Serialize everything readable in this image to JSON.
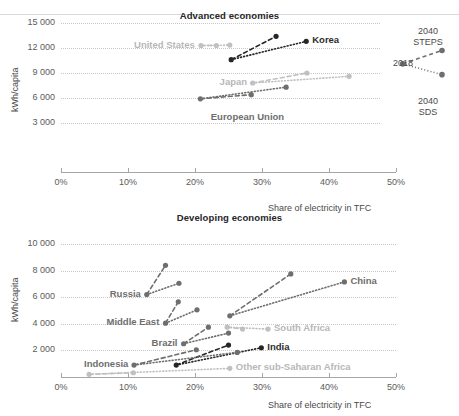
{
  "figure": {
    "ylabel": "kWh/capita",
    "xlabel": "Share of electricity in TFC"
  },
  "legend": {
    "base_label": "2018",
    "steps_label_line1": "2040",
    "steps_label_line2": "STEPS",
    "sds_label_line1": "2040",
    "sds_label_line2": "SDS",
    "base_point": {
      "x": 51.0,
      "y": 10100
    },
    "steps_point": {
      "x": 57.0,
      "y": 11700
    },
    "sds_point": {
      "x": 57.0,
      "y": 8800
    }
  },
  "colors": {
    "dark": "#262626",
    "mid": "#6e6e6e",
    "light": "#c0c0c0",
    "grid": "#c7c7c7",
    "axis": "#a6a6a6"
  },
  "chart_data": [
    {
      "type": "line",
      "title": "Advanced economies",
      "xlabel": "Share of electricity in TFC",
      "ylabel": "kWh/capita",
      "xlim": [
        0,
        50
      ],
      "ylim": [
        0,
        15000
      ],
      "xticks": [
        "0%",
        "10%",
        "20%",
        "30%",
        "40%",
        "50%"
      ],
      "xtick_values": [
        0,
        10,
        20,
        30,
        40,
        50
      ],
      "yticks": [
        "3 000",
        "6 000",
        "9 000",
        "12 000",
        "15 000"
      ],
      "ytick_values": [
        3000,
        6000,
        9000,
        12000,
        15000
      ],
      "grid": true,
      "legend_position": "right-outside",
      "series": [
        {
          "name": "United States",
          "tone": "light",
          "label_side": "left",
          "points": {
            "base": {
              "x": 20.9,
              "y": 12300
            },
            "steps": {
              "x": 23.2,
              "y": 12300
            },
            "sds": {
              "x": 25.2,
              "y": 12350
            }
          }
        },
        {
          "name": "Korea",
          "tone": "dark",
          "label_side": "right",
          "points": {
            "base": {
              "x": 25.4,
              "y": 10600
            },
            "steps": {
              "x": 32.1,
              "y": 13400
            },
            "sds": {
              "x": 36.6,
              "y": 12800
            }
          }
        },
        {
          "name": "Japan",
          "tone": "light",
          "label_side": "left",
          "points": {
            "base": {
              "x": 28.6,
              "y": 7800
            },
            "steps": {
              "x": 36.7,
              "y": 9000
            },
            "sds": {
              "x": 43.0,
              "y": 8600
            }
          }
        },
        {
          "name": "European Union",
          "tone": "mid",
          "label_side": "below",
          "points": {
            "base": {
              "x": 20.8,
              "y": 5900
            },
            "steps": {
              "x": 28.4,
              "y": 6400
            },
            "sds": {
              "x": 33.6,
              "y": 7300
            }
          }
        }
      ]
    },
    {
      "type": "line",
      "title": "Developing economies",
      "xlabel": "Share of electricity in TFC",
      "ylabel": "kWh/capita",
      "xlim": [
        0,
        50
      ],
      "ylim": [
        0,
        10000
      ],
      "xticks": [
        "0%",
        "10%",
        "20%",
        "30%",
        "40%",
        "50%"
      ],
      "xtick_values": [
        0,
        10,
        20,
        30,
        40,
        50
      ],
      "yticks": [
        "2 000",
        "4 000",
        "6 000",
        "8 000",
        "10 000"
      ],
      "ytick_values": [
        2000,
        4000,
        6000,
        8000,
        10000
      ],
      "grid": true,
      "legend_position": "none",
      "series": [
        {
          "name": "Russia",
          "tone": "mid",
          "label_side": "left",
          "points": {
            "base": {
              "x": 12.8,
              "y": 6200
            },
            "steps": {
              "x": 15.6,
              "y": 8400
            },
            "sds": {
              "x": 17.6,
              "y": 7050
            }
          }
        },
        {
          "name": "Middle East",
          "tone": "mid",
          "label_side": "left",
          "points": {
            "base": {
              "x": 15.6,
              "y": 4050
            },
            "steps": {
              "x": 17.5,
              "y": 5650
            },
            "sds": {
              "x": 20.3,
              "y": 5050
            }
          }
        },
        {
          "name": "Brazil",
          "tone": "mid",
          "label_side": "left",
          "points": {
            "base": {
              "x": 18.3,
              "y": 2500
            },
            "steps": {
              "x": 22.0,
              "y": 3750
            },
            "sds": {
              "x": 25.0,
              "y": 3300
            }
          }
        },
        {
          "name": "China",
          "tone": "mid",
          "label_side": "right",
          "points": {
            "base": {
              "x": 25.2,
              "y": 4600
            },
            "steps": {
              "x": 34.3,
              "y": 7750
            },
            "sds": {
              "x": 42.3,
              "y": 7150
            }
          }
        },
        {
          "name": "South Africa",
          "tone": "light",
          "label_side": "right",
          "points": {
            "base": {
              "x": 24.8,
              "y": 3750
            },
            "steps": {
              "x": 27.1,
              "y": 3600
            },
            "sds": {
              "x": 30.9,
              "y": 3600
            }
          }
        },
        {
          "name": "India",
          "tone": "dark",
          "label_side": "right",
          "points": {
            "base": {
              "x": 17.2,
              "y": 900
            },
            "steps": {
              "x": 25.0,
              "y": 2400
            },
            "sds": {
              "x": 29.9,
              "y": 2200
            }
          }
        },
        {
          "name": "Indonesia",
          "tone": "mid",
          "label_side": "left",
          "points": {
            "base": {
              "x": 10.9,
              "y": 900
            },
            "steps": {
              "x": 20.2,
              "y": 2050
            },
            "sds": {
              "x": 26.3,
              "y": 1850
            }
          }
        },
        {
          "name": "Other sub-Saharan Africa",
          "tone": "light",
          "label_side": "right",
          "points": {
            "base": {
              "x": 4.2,
              "y": 200
            },
            "steps": {
              "x": 10.8,
              "y": 320
            },
            "sds": {
              "x": 25.2,
              "y": 650
            }
          }
        }
      ]
    }
  ]
}
